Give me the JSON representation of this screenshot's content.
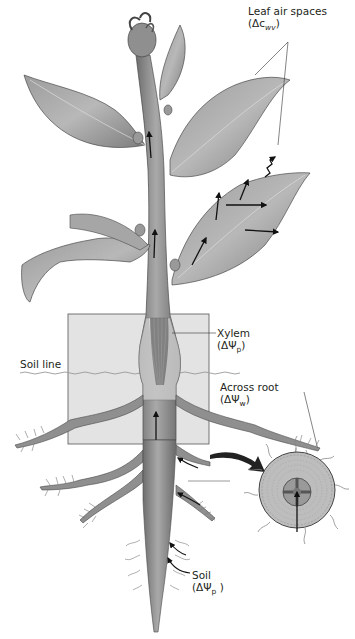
{
  "figure": {
    "colors": {
      "plant_fill": "#8a8a8a",
      "plant_dark": "#5a5a5a",
      "plant_light": "#bdbdbd",
      "soil_box": "#e2e2e2",
      "soil_line": "#9a9a9a",
      "arrow": "#111111",
      "text": "#231f20"
    }
  },
  "labels": {
    "leaf_air_spaces": {
      "title": "Leaf air spaces",
      "symbol": "(Δc",
      "subscript": "wv",
      "close": ")"
    },
    "xylem": {
      "title": "Xylem",
      "symbol": "(ΔΨ",
      "subscript": "p",
      "close": ")"
    },
    "soil_line": {
      "title": "Soil line"
    },
    "across_root": {
      "title": "Across root",
      "symbol": "(ΔΨ",
      "subscript": "w",
      "close": ")"
    },
    "soil": {
      "title": "Soil",
      "symbol": "(ΔΨ",
      "subscript": "p",
      "close": " )"
    }
  }
}
